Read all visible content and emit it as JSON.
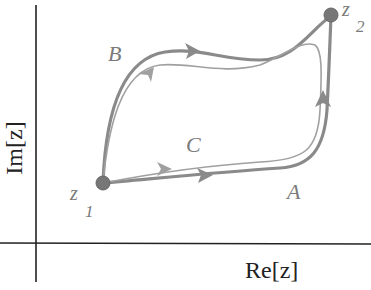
{
  "axes": {
    "x_label": "Re[z]",
    "y_label": "Im[z]"
  },
  "points": {
    "z1": {
      "label": "z",
      "subscript": "1"
    },
    "z2": {
      "label": "z",
      "subscript": "2"
    }
  },
  "paths": {
    "A": {
      "label": "A"
    },
    "B": {
      "label": "B"
    },
    "C": {
      "label": "C"
    }
  },
  "colors": {
    "path_thick": "#8a8a8a",
    "path_thin": "#a0a0a0",
    "point": "#777777",
    "axis": "#222222",
    "label": "#7a7a7a"
  }
}
